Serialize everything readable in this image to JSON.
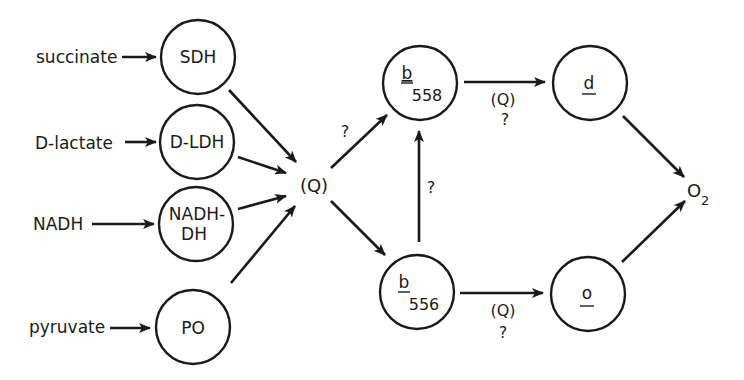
{
  "diagram": {
    "substrates": [
      {
        "id": "succinate",
        "label": "succinate"
      },
      {
        "id": "d-lactate",
        "label": "D-lactate"
      },
      {
        "id": "nadh",
        "label": "NADH"
      },
      {
        "id": "pyruvate",
        "label": "pyruvate"
      }
    ],
    "dehydrogenases": [
      {
        "id": "sdh",
        "label": "SDH"
      },
      {
        "id": "d-ldh",
        "label": "D-LDH"
      },
      {
        "id": "nadh-dh",
        "label_line1": "NADH-",
        "label_line2": "DH"
      },
      {
        "id": "po",
        "label": "PO"
      }
    ],
    "quinone_pool": {
      "label": "(Q)"
    },
    "cytochromes_b": [
      {
        "id": "b558",
        "letter": "b",
        "subscript": "558"
      },
      {
        "id": "b556",
        "letter": "b",
        "subscript": "556"
      }
    ],
    "oxidases": [
      {
        "id": "d",
        "label": "d"
      },
      {
        "id": "o",
        "label": "o"
      }
    ],
    "terminal_acceptor": {
      "base": "O",
      "subscript": "2"
    },
    "edge_labels": {
      "q_to_b558": "?",
      "b556_to_b558": "?",
      "b558_to_d_top": "(Q)",
      "b558_to_d_bottom": "?",
      "b556_to_o_top": "(Q)",
      "b556_to_o_bottom": "?"
    }
  }
}
